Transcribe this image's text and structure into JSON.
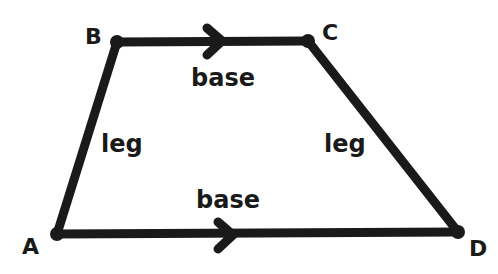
{
  "diagram": {
    "shape": "trapezoid",
    "colors": {
      "stroke": "#1a1a1a",
      "background": "#ffffff"
    },
    "vertices": [
      {
        "label": "A",
        "x": 57,
        "y": 234
      },
      {
        "label": "B",
        "x": 117,
        "y": 42
      },
      {
        "label": "C",
        "x": 308,
        "y": 41
      },
      {
        "label": "D",
        "x": 458,
        "y": 232
      }
    ],
    "sides": [
      {
        "from": "B",
        "to": "C",
        "label": "base",
        "parallel_arrow": true
      },
      {
        "from": "A",
        "to": "D",
        "label": "base",
        "parallel_arrow": true
      },
      {
        "from": "A",
        "to": "B",
        "label": "leg",
        "parallel_arrow": false
      },
      {
        "from": "C",
        "to": "D",
        "label": "leg",
        "parallel_arrow": false
      }
    ],
    "labels": {
      "A": "A",
      "B": "B",
      "C": "C",
      "D": "D",
      "top_base": "base",
      "bottom_base": "base",
      "left_leg": "leg",
      "right_leg": "leg"
    }
  }
}
